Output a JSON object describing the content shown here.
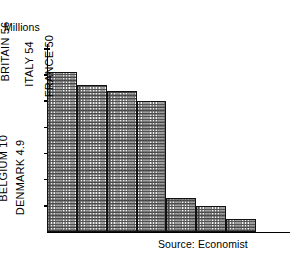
{
  "chart_data": {
    "type": "bar",
    "title": "",
    "subtitle": "",
    "xlabel": "",
    "ylabel": "Millions",
    "ylim": [
      0,
      70
    ],
    "grid": false,
    "legend": "none",
    "orientation": "vertical",
    "bar_fill": "checkered-halftone",
    "categories": [
      "GERMANY",
      "BRITAIN",
      "ITALY",
      "FRANCE",
      "HOLLAND",
      "BELGIUM",
      "DENMARK"
    ],
    "values": [
      61,
      56,
      54,
      50,
      12.9,
      10,
      4.9
    ],
    "bar_labels": [
      "GERMANY 61",
      "BRITAIN 56",
      "ITALY 54",
      "FRANCE 50",
      "HOLLAND 12.9",
      "BELGIUM 10",
      "DENMARK 4.9"
    ],
    "yticks": [
      70,
      60,
      50,
      40,
      30,
      20,
      10
    ],
    "ytick_labels": [
      "70",
      "60",
      "50",
      "40",
      "30",
      "20",
      "10"
    ],
    "annotations": [
      "Source: Economist"
    ]
  },
  "axis": {
    "y_title": "Millions",
    "ticks": [
      {
        "label": "70",
        "value": 70
      },
      {
        "label": "60",
        "value": 60
      },
      {
        "label": "50",
        "value": 50
      },
      {
        "label": "40",
        "value": 40
      },
      {
        "label": "30",
        "value": 30
      },
      {
        "label": "20",
        "value": 20
      },
      {
        "label": "10",
        "value": 10
      }
    ]
  },
  "bars": [
    {
      "label": "GERMANY 61",
      "name": "germany",
      "value": 61
    },
    {
      "label": "BRITAIN 56",
      "name": "britain",
      "value": 56
    },
    {
      "label": "ITALY 54",
      "name": "italy",
      "value": 54
    },
    {
      "label": "FRANCE 50",
      "name": "france",
      "value": 50
    },
    {
      "label": "HOLLAND 12.9",
      "name": "holland",
      "value": 12.9
    },
    {
      "label": "BELGIUM 10",
      "name": "belgium",
      "value": 10
    },
    {
      "label": "DENMARK 4.9",
      "name": "denmark",
      "value": 4.9
    }
  ],
  "source": {
    "text": "Source: Economist"
  },
  "colors": {
    "ink": "#000000",
    "bar_outline": "#111111",
    "bar_fill_base": "#f2f2f2",
    "background": "#ffffff"
  }
}
